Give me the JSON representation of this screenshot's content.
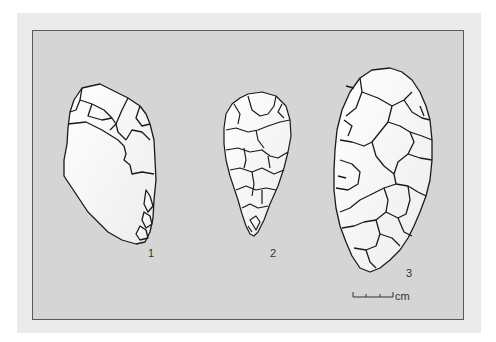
{
  "figure": {
    "artifacts": [
      {
        "id": "1",
        "label": "1"
      },
      {
        "id": "2",
        "label": "2"
      },
      {
        "id": "3",
        "label": "3"
      }
    ],
    "scale_bar": {
      "unit": "cm",
      "segments": 3
    }
  },
  "colors": {
    "page_background": "#ffffff",
    "outer_panel": "#ebebeb",
    "inner_panel": "#d5d5d5",
    "artifact_fill": "#ffffff",
    "outline": "#1a1a1a"
  }
}
